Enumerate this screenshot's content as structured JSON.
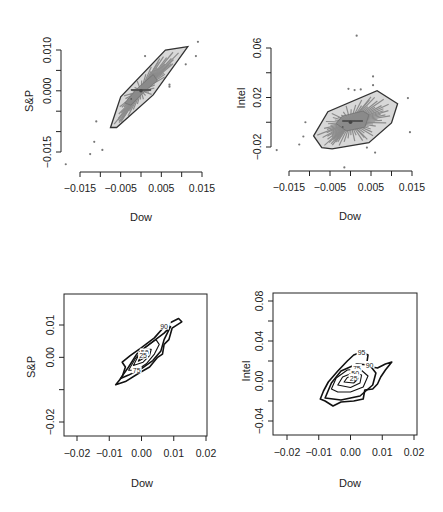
{
  "figure": {
    "width": 443,
    "height": 512,
    "background": "#ffffff",
    "colors": {
      "axis": "#222222",
      "hull_fill": "#d8d8d8",
      "hull_stroke": "#333333",
      "bag_fill": "#8a8a8a",
      "spoke": "#8c8c8c",
      "outlier": "#777777",
      "contour": "#111111"
    }
  },
  "chart_data": [
    {
      "id": "bagplot-dow-sp",
      "type": "scatter",
      "subtype": "bagplot",
      "title": "",
      "xlabel": "Dow",
      "ylabel": "S&P",
      "xlim": [
        -0.018,
        0.015
      ],
      "ylim": [
        -0.017,
        0.012
      ],
      "xticks": [
        -0.015,
        -0.01,
        -0.005,
        0.0,
        0.005,
        0.01,
        0.015
      ],
      "xtick_labels": [
        "-0.015",
        "",
        "-0.005",
        "",
        "0.005",
        "",
        "0.015"
      ],
      "yticks": [
        -0.015,
        -0.01,
        -0.005,
        0.0,
        0.005,
        0.01
      ],
      "ytick_labels": [
        "-0.015",
        "",
        "",
        "0.000",
        "",
        "0.010"
      ],
      "grid": false,
      "frame": "open-axes",
      "fence_hull": [
        [
          -0.0075,
          -0.009
        ],
        [
          -0.005,
          -0.0015
        ],
        [
          0.006,
          0.01
        ],
        [
          0.0115,
          0.0108
        ],
        [
          0.003,
          -0.001
        ],
        [
          -0.006,
          -0.009
        ]
      ],
      "bag_hull": [
        [
          -0.004,
          -0.003
        ],
        [
          -0.001,
          0.0005
        ],
        [
          0.003,
          0.004
        ],
        [
          0.004,
          0.0025
        ],
        [
          0.0005,
          -0.0005
        ],
        [
          -0.0025,
          -0.0035
        ]
      ],
      "center": [
        0.0,
        0.0
      ],
      "outliers": [
        [
          0.014,
          0.012
        ],
        [
          0.0135,
          0.0085
        ],
        [
          0.011,
          0.0065
        ],
        [
          0.001,
          0.0085
        ],
        [
          0.007,
          0.0015
        ],
        [
          0.007,
          0.001
        ],
        [
          -0.011,
          -0.0075
        ],
        [
          -0.0115,
          -0.0125
        ],
        [
          -0.0125,
          -0.0155
        ],
        [
          -0.0095,
          -0.0145
        ],
        [
          -0.0185,
          -0.018
        ]
      ]
    },
    {
      "id": "bagplot-dow-intel",
      "type": "scatter",
      "subtype": "bagplot",
      "title": "",
      "xlabel": "Dow",
      "ylabel": "Intel",
      "xlim": [
        -0.018,
        0.016
      ],
      "ylim": [
        -0.027,
        0.072
      ],
      "xticks": [
        -0.015,
        -0.01,
        -0.005,
        0.0,
        0.005,
        0.01,
        0.015
      ],
      "xtick_labels": [
        "-0.015",
        "",
        "-0.005",
        "",
        "0.005",
        "",
        "0.015"
      ],
      "yticks": [
        -0.02,
        0.0,
        0.02,
        0.04,
        0.06
      ],
      "ytick_labels": [
        "-0.02",
        "",
        "0.02",
        "",
        "0.06"
      ],
      "grid": false,
      "frame": "open-axes",
      "fence_hull": [
        [
          -0.009,
          -0.011
        ],
        [
          -0.0055,
          0.0085
        ],
        [
          0.0065,
          0.0255
        ],
        [
          0.0115,
          0.015
        ],
        [
          0.01,
          -0.0005
        ],
        [
          0.0045,
          -0.0165
        ],
        [
          -0.0045,
          -0.0215
        ],
        [
          -0.007,
          -0.0205
        ]
      ],
      "bag_hull": [
        [
          -0.0035,
          -0.001
        ],
        [
          -0.002,
          0.005
        ],
        [
          0.003,
          0.009
        ],
        [
          0.0045,
          0.006
        ],
        [
          0.0035,
          -0.004
        ],
        [
          -0.001,
          -0.007
        ]
      ],
      "center": [
        0.0,
        0.0
      ],
      "outliers": [
        [
          0.0015,
          0.07
        ],
        [
          0.0055,
          0.037
        ],
        [
          0.0055,
          0.03
        ],
        [
          -0.0005,
          0.027
        ],
        [
          0.001,
          0.026
        ],
        [
          0.0025,
          0.0265
        ],
        [
          0.014,
          0.0195
        ],
        [
          0.0145,
          -0.008
        ],
        [
          -0.011,
          0.0
        ],
        [
          -0.0115,
          -0.0115
        ],
        [
          -0.0125,
          -0.018
        ],
        [
          -0.018,
          -0.0225
        ],
        [
          0.004,
          -0.0205
        ],
        [
          0.006,
          -0.0245
        ],
        [
          -0.0015,
          -0.0365
        ]
      ]
    },
    {
      "id": "contour-dow-sp",
      "type": "contour",
      "title": "",
      "xlabel": "Dow",
      "ylabel": "S&P",
      "xlim": [
        -0.0235,
        0.0205
      ],
      "ylim": [
        -0.0237,
        0.0202
      ],
      "xticks": [
        -0.02,
        -0.01,
        0.0,
        0.01,
        0.02
      ],
      "xtick_labels": [
        "-0.02",
        "-0.01",
        "0.00",
        "0.01",
        "0.02"
      ],
      "yticks": [
        -0.02,
        -0.01,
        0.0,
        0.01
      ],
      "ytick_labels": [
        "-0.02",
        "",
        "0.00",
        "0.01"
      ],
      "grid": false,
      "frame": "box",
      "levels": [
        {
          "label": "95",
          "label_at": [
            0.0075,
            0.01
          ],
          "points": [
            [
              -0.008,
              -0.0085
            ],
            [
              -0.006,
              -0.006
            ],
            [
              -0.005,
              -0.003
            ],
            [
              -0.006,
              -0.0015
            ],
            [
              -0.0035,
              0.0005
            ],
            [
              0.0,
              0.003
            ],
            [
              0.004,
              0.006
            ],
            [
              0.0075,
              0.01
            ],
            [
              0.0115,
              0.012
            ],
            [
              0.0125,
              0.011
            ],
            [
              0.0095,
              0.009
            ],
            [
              0.0085,
              0.0055
            ],
            [
              0.007,
              0.004
            ],
            [
              0.0065,
              0.001
            ],
            [
              0.005,
              0.0
            ],
            [
              0.0025,
              -0.003
            ],
            [
              -0.001,
              -0.005
            ],
            [
              -0.005,
              -0.0075
            ],
            [
              -0.008,
              -0.0085
            ]
          ]
        },
        {
          "label": "90",
          "label_at": [
            0.007,
            0.0095
          ],
          "points": [
            [
              -0.0065,
              -0.0065
            ],
            [
              -0.004,
              -0.003
            ],
            [
              -0.0015,
              0.001
            ],
            [
              0.003,
              0.0045
            ],
            [
              0.007,
              0.0075
            ],
            [
              0.009,
              0.0095
            ],
            [
              0.007,
              0.0055
            ],
            [
              0.006,
              0.002
            ],
            [
              0.0035,
              -0.001
            ],
            [
              0.0,
              -0.0035
            ],
            [
              -0.004,
              -0.0055
            ],
            [
              -0.0065,
              -0.0065
            ]
          ]
        },
        {
          "label": "75",
          "label_at": [
            -0.0015,
            -0.004
          ],
          "points": [
            [
              -0.004,
              -0.004
            ],
            [
              -0.002,
              -0.0005
            ],
            [
              0.001,
              0.003
            ],
            [
              0.0045,
              0.0055
            ],
            [
              0.0055,
              0.004
            ],
            [
              0.004,
              0.001
            ],
            [
              0.0015,
              -0.002
            ],
            [
              -0.0015,
              -0.004
            ],
            [
              -0.004,
              -0.004
            ]
          ]
        },
        {
          "label": "50",
          "label_at": [
            0.001,
            0.0015
          ],
          "points": [
            [
              -0.0025,
              -0.0025
            ],
            [
              -0.001,
              0.0005
            ],
            [
              0.0015,
              0.0025
            ],
            [
              0.003,
              0.0025
            ],
            [
              0.0025,
              0.0005
            ],
            [
              0.0005,
              -0.0015
            ],
            [
              -0.0025,
              -0.0025
            ]
          ]
        },
        {
          "label": "25",
          "label_at": [
            0.0005,
            0.0005
          ],
          "points": [
            [
              -0.001,
              -0.0012
            ],
            [
              0.0,
              0.0008
            ],
            [
              0.0018,
              0.0018
            ],
            [
              0.0015,
              0.0002
            ],
            [
              -0.001,
              -0.0012
            ]
          ]
        }
      ]
    },
    {
      "id": "contour-dow-intel",
      "type": "contour",
      "title": "",
      "xlabel": "Dow",
      "ylabel": "Intel",
      "xlim": [
        -0.0235,
        0.0205
      ],
      "ylim": [
        -0.0465,
        0.0895
      ],
      "xticks": [
        -0.02,
        -0.01,
        0.0,
        0.01,
        0.02
      ],
      "xtick_labels": [
        "-0.02",
        "-0.01",
        "0.00",
        "0.01",
        "0.02"
      ],
      "yticks": [
        -0.04,
        -0.02,
        0.0,
        0.02,
        0.04,
        0.06,
        0.08
      ],
      "ytick_labels": [
        "-0.04",
        "",
        "0.00",
        "",
        "0.04",
        "",
        "0.08"
      ],
      "grid": false,
      "frame": "box",
      "levels": [
        {
          "label": "95",
          "label_at": [
            0.0035,
            0.029
          ],
          "points": [
            [
              -0.0095,
              -0.018
            ],
            [
              -0.0085,
              -0.01
            ],
            [
              -0.007,
              -0.001
            ],
            [
              -0.004,
              0.01
            ],
            [
              -0.001,
              0.02
            ],
            [
              0.001,
              0.026
            ],
            [
              0.0035,
              0.029
            ],
            [
              0.0055,
              0.026
            ],
            [
              0.005,
              0.015
            ],
            [
              0.0085,
              0.013
            ],
            [
              0.011,
              0.017
            ],
            [
              0.013,
              0.019
            ],
            [
              0.011,
              0.011
            ],
            [
              0.0095,
              0.004
            ],
            [
              0.0085,
              -0.003
            ],
            [
              0.007,
              -0.008
            ],
            [
              0.0045,
              -0.009
            ],
            [
              0.004,
              -0.018
            ],
            [
              0.001,
              -0.02
            ],
            [
              -0.003,
              -0.021
            ],
            [
              -0.0055,
              -0.025
            ],
            [
              -0.008,
              -0.02
            ],
            [
              -0.0095,
              -0.018
            ]
          ]
        },
        {
          "label": "90",
          "label_at": [
            0.006,
            0.016
          ],
          "points": [
            [
              -0.008,
              -0.017
            ],
            [
              -0.006,
              -0.002
            ],
            [
              -0.003,
              0.01
            ],
            [
              0.002,
              0.017
            ],
            [
              0.006,
              0.016
            ],
            [
              0.008,
              0.008
            ],
            [
              0.007,
              -0.004
            ],
            [
              0.003,
              -0.015
            ],
            [
              -0.003,
              -0.019
            ],
            [
              -0.008,
              -0.017
            ]
          ]
        },
        {
          "label": "75",
          "label_at": [
            0.002,
            0.013
          ],
          "points": [
            [
              -0.006,
              -0.008
            ],
            [
              -0.0045,
              0.003
            ],
            [
              -0.001,
              0.011
            ],
            [
              0.003,
              0.012
            ],
            [
              0.0055,
              0.005
            ],
            [
              0.004,
              -0.006
            ],
            [
              0.0,
              -0.011
            ],
            [
              -0.004,
              -0.011
            ],
            [
              -0.006,
              -0.008
            ]
          ]
        },
        {
          "label": "50",
          "label_at": [
            0.0015,
            0.008
          ],
          "points": [
            [
              -0.004,
              -0.004
            ],
            [
              -0.0025,
              0.004
            ],
            [
              0.001,
              0.0085
            ],
            [
              0.0035,
              0.006
            ],
            [
              0.003,
              -0.002
            ],
            [
              0.0,
              -0.0065
            ],
            [
              -0.004,
              -0.004
            ]
          ]
        },
        {
          "label": "25",
          "label_at": [
            0.001,
            0.003
          ],
          "points": [
            [
              -0.002,
              -0.001
            ],
            [
              -0.001,
              0.0035
            ],
            [
              0.0015,
              0.0055
            ],
            [
              0.0025,
              0.0025
            ],
            [
              0.001,
              -0.002
            ],
            [
              -0.002,
              -0.001
            ]
          ]
        }
      ]
    }
  ],
  "panels": {
    "top_left": {
      "xlabel": "Dow",
      "ylabel": "S&P"
    },
    "top_right": {
      "xlabel": "Dow",
      "ylabel": "Intel"
    },
    "bottom_left": {
      "xlabel": "Dow",
      "ylabel": "S&P"
    },
    "bottom_right": {
      "xlabel": "Dow",
      "ylabel": "Intel"
    }
  }
}
